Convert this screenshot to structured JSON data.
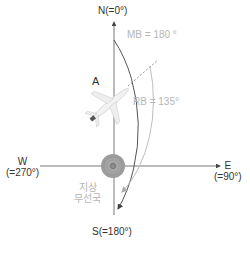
{
  "labels": {
    "north": "N(=0°)",
    "south": "S(=180°)",
    "west_letter": "W",
    "west_deg": "(=270°)",
    "east_letter": "E",
    "east_deg": "(=90°)",
    "aircraft": "A",
    "mb": "MB = 180 °",
    "rb": "RB = 135°",
    "station_line1": "지상",
    "station_line2": "무선국"
  },
  "colors": {
    "axis": "#555555",
    "outer_arc": "#555555",
    "inner_arc": "#bdbdbd",
    "dashed_line": "#777777",
    "text_dark": "#333333",
    "text_light": "#b5b5b5"
  }
}
